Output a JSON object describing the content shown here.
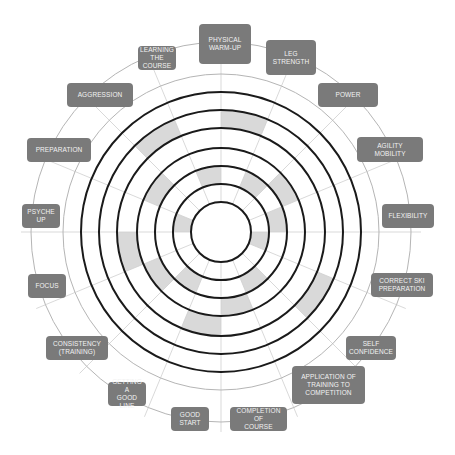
{
  "diagram": {
    "type": "performance-wheel",
    "center": [
      221,
      232
    ],
    "black_ring_radii": [
      30,
      48,
      66,
      84,
      104,
      122,
      140
    ],
    "gray_ring_radii": [
      158,
      190
    ],
    "spoke_count": 16,
    "spoke_inner_radius": 30,
    "spoke_outer_radius": 200,
    "colors": {
      "ring": "#1a1a1a",
      "gray_ring": "#b5b5b5",
      "spoke": "#cfcfcf",
      "shade": "#d9d9d9",
      "label_box": "#7a7a7a",
      "label_text": "#f2f2f2"
    },
    "segments": [
      {
        "label": "PHYSICAL\nWARM-UP",
        "score": 6
      },
      {
        "label": "LEG STRENGTH",
        "score": 3
      },
      {
        "label": "POWER",
        "score": 4
      },
      {
        "label": "AGILITY\nMOBILITY",
        "score": 3
      },
      {
        "label": "FLEXIBILITY",
        "score": 2
      },
      {
        "label": "CORRECT SKI\nPREPARATION",
        "score": 6
      },
      {
        "label": "SELF\nCONFIDENCE",
        "score": 3
      },
      {
        "label": "APPLICATION OF\nTRAINING TO\nCOMPETITION",
        "score": 4
      },
      {
        "label": "COMPLETION OF\nCOURSE",
        "score": 5
      },
      {
        "label": "GOOD\nSTART",
        "score": 3
      },
      {
        "label": "GETTING A\nGOOD LINE",
        "score": 4
      },
      {
        "label": "CONSISTENCY\n(TRAINING)",
        "score": 5
      },
      {
        "label": "FOCUS",
        "score": 2
      },
      {
        "label": "PSYCHE UP",
        "score": 4
      },
      {
        "label": "PREPARATION",
        "score": 6
      },
      {
        "label": "AGGRESSION",
        "score": 3
      },
      {
        "label": "LEARNING\nTHE COURSE",
        "score": 5
      }
    ]
  },
  "labels": [
    {
      "id": "physical-warm-up",
      "text": "PHYSICAL\nWARM-UP",
      "x": 199,
      "y": 24,
      "w": 52,
      "h": 40
    },
    {
      "id": "leg-strength",
      "text": "LEG STRENGTH",
      "x": 266,
      "y": 40,
      "w": 50,
      "h": 35
    },
    {
      "id": "power",
      "text": "POWER",
      "x": 318,
      "y": 83,
      "w": 60,
      "h": 24
    },
    {
      "id": "agility-mobility",
      "text": "AGILITY\nMOBILITY",
      "x": 357,
      "y": 137,
      "w": 66,
      "h": 25
    },
    {
      "id": "flexibility",
      "text": "FLEXIBILITY",
      "x": 382,
      "y": 204,
      "w": 52,
      "h": 24
    },
    {
      "id": "correct-ski-preparation",
      "text": "CORRECT SKI\nPREPARATION",
      "x": 371,
      "y": 273,
      "w": 62,
      "h": 24
    },
    {
      "id": "self-confidence",
      "text": "SELF\nCONFIDENCE",
      "x": 346,
      "y": 336,
      "w": 50,
      "h": 24
    },
    {
      "id": "application-training",
      "text": "APPLICATION OF\nTRAINING TO\nCOMPETITION",
      "x": 292,
      "y": 366,
      "w": 73,
      "h": 38
    },
    {
      "id": "completion-of-course",
      "text": "COMPLETION OF\nCOURSE",
      "x": 230,
      "y": 407,
      "w": 57,
      "h": 24
    },
    {
      "id": "good-start",
      "text": "GOOD\nSTART",
      "x": 171,
      "y": 407,
      "w": 38,
      "h": 24
    },
    {
      "id": "getting-good-line",
      "text": "GETTING A\nGOOD LINE",
      "x": 108,
      "y": 382,
      "w": 38,
      "h": 24
    },
    {
      "id": "consistency-training",
      "text": "CONSISTENCY\n(TRAINING)",
      "x": 46,
      "y": 336,
      "w": 62,
      "h": 24
    },
    {
      "id": "focus",
      "text": "FOCUS",
      "x": 28,
      "y": 274,
      "w": 38,
      "h": 24
    },
    {
      "id": "psyche-up",
      "text": "PSYCHE UP",
      "x": 22,
      "y": 204,
      "w": 38,
      "h": 24
    },
    {
      "id": "preparation",
      "text": "PREPARATION",
      "x": 27,
      "y": 138,
      "w": 64,
      "h": 24
    },
    {
      "id": "aggression",
      "text": "AGGRESSION",
      "x": 67,
      "y": 83,
      "w": 66,
      "h": 24
    },
    {
      "id": "learning-the-course",
      "text": "LEARNING\nTHE COURSE",
      "x": 138,
      "y": 46,
      "w": 38,
      "h": 24
    }
  ]
}
